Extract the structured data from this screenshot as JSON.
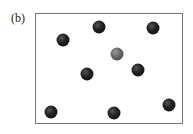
{
  "figure": {
    "label": "(b)",
    "dots": [
      {
        "x": 99,
        "y": 27,
        "kind": "black"
      },
      {
        "x": 153,
        "y": 28,
        "kind": "black"
      },
      {
        "x": 63,
        "y": 40,
        "kind": "black"
      },
      {
        "x": 117,
        "y": 54,
        "kind": "grey"
      },
      {
        "x": 138,
        "y": 70,
        "kind": "black"
      },
      {
        "x": 87,
        "y": 74,
        "kind": "black"
      },
      {
        "x": 169,
        "y": 105,
        "kind": "black"
      },
      {
        "x": 51,
        "y": 112,
        "kind": "black"
      },
      {
        "x": 114,
        "y": 113,
        "kind": "black"
      }
    ]
  }
}
